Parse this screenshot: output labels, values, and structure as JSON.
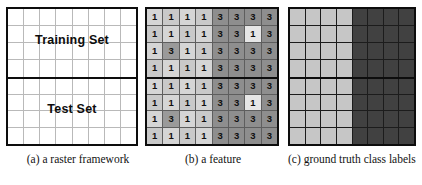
{
  "figure": {
    "panels": [
      {
        "id": "raster-framework",
        "caption": "(a)  a raster framework",
        "labels": {
          "training": "Training Set",
          "test": "Test Set"
        }
      },
      {
        "id": "feature",
        "caption": "(b)  a feature"
      },
      {
        "id": "ground-truth",
        "caption": "(c)  ground truth class labels"
      }
    ]
  },
  "colors": {
    "border": "#0d0d0d",
    "panel_a_grid_line": "#b9b9b9",
    "panel_a_fill": "#ffffff",
    "feature_light": "#c9c9c9",
    "feature_light_alt": "#d5d5d5",
    "feature_dark": "#8e8e8e",
    "feature_anomaly_dark": "#9a9a9a",
    "feature_anomaly_light": "#e6e6e6",
    "class_label_light": "#c6c6c6",
    "class_label_dark": "#414141"
  },
  "chart_data": {
    "type": "heatmap",
    "grid_size": [
      8,
      8
    ],
    "split": {
      "training_rows": [
        0,
        1,
        2,
        3
      ],
      "test_rows": [
        4,
        5,
        6,
        7
      ]
    },
    "panel_a": {
      "title": "(a)  a raster framework",
      "description": "8 x 8 empty raster grid split horizontally into a Training Set half (top 4 rows) and a Test Set half (bottom 4 rows)",
      "rows": [
        [
          "",
          "",
          "",
          "",
          "",
          "",
          "",
          ""
        ],
        [
          "",
          "",
          "",
          "",
          "",
          "",
          "",
          ""
        ],
        [
          "",
          "",
          "",
          "",
          "",
          "",
          "",
          ""
        ],
        [
          "",
          "",
          "",
          "",
          "",
          "",
          "",
          ""
        ],
        [
          "",
          "",
          "",
          "",
          "",
          "",
          "",
          ""
        ],
        [
          "",
          "",
          "",
          "",
          "",
          "",
          "",
          ""
        ],
        [
          "",
          "",
          "",
          "",
          "",
          "",
          "",
          ""
        ],
        [
          "",
          "",
          "",
          "",
          "",
          "",
          "",
          ""
        ]
      ]
    },
    "panel_b": {
      "title": "(b)  a feature",
      "description": "8 x 8 grid of feature values; left four columns are 1 on light background, right four columns are 3 on dark background, with two anomalies",
      "values": [
        [
          1,
          1,
          1,
          1,
          3,
          3,
          3,
          3
        ],
        [
          1,
          1,
          1,
          1,
          3,
          3,
          1,
          3
        ],
        [
          1,
          3,
          1,
          1,
          3,
          3,
          3,
          3
        ],
        [
          1,
          1,
          1,
          1,
          3,
          3,
          3,
          3
        ],
        [
          1,
          1,
          1,
          1,
          3,
          3,
          3,
          3
        ],
        [
          1,
          1,
          1,
          1,
          3,
          3,
          1,
          3
        ],
        [
          1,
          3,
          1,
          1,
          3,
          3,
          3,
          3
        ],
        [
          1,
          1,
          1,
          1,
          3,
          3,
          3,
          3
        ]
      ],
      "shades": [
        [
          "light",
          "light",
          "light",
          "light",
          "dark",
          "dark",
          "dark",
          "dark"
        ],
        [
          "light",
          "light",
          "light",
          "light",
          "dark",
          "dark",
          "anomaly_light",
          "dark"
        ],
        [
          "light",
          "anomaly_dark",
          "light",
          "light",
          "dark",
          "dark",
          "dark",
          "dark"
        ],
        [
          "light",
          "light",
          "light",
          "light",
          "dark",
          "dark",
          "dark",
          "dark"
        ],
        [
          "light",
          "light",
          "light",
          "light",
          "dark",
          "dark",
          "dark",
          "dark"
        ],
        [
          "light",
          "light",
          "light",
          "light",
          "dark",
          "dark",
          "anomaly_light",
          "dark"
        ],
        [
          "light",
          "anomaly_dark",
          "light",
          "light",
          "dark",
          "dark",
          "dark",
          "dark"
        ],
        [
          "light",
          "light",
          "light",
          "light",
          "dark",
          "dark",
          "dark",
          "dark"
        ]
      ],
      "anomalies": [
        {
          "row": 1,
          "col": 6,
          "value": 1,
          "note": "outlier 1 inside the 3 region"
        },
        {
          "row": 2,
          "col": 1,
          "value": 3,
          "note": "outlier 3 inside the 1 region"
        },
        {
          "row": 5,
          "col": 6,
          "value": 1,
          "note": "outlier 1 inside the 3 region"
        },
        {
          "row": 6,
          "col": 1,
          "value": 3,
          "note": "outlier 3 inside the 1 region"
        }
      ]
    },
    "panel_c": {
      "title": "(c)  ground truth class labels",
      "description": "8 x 8 grid of ground truth class labels; left four columns class A (light gray), right four columns class B (dark gray)",
      "classes": [
        {
          "name": "class-a",
          "color": "#c6c6c6"
        },
        {
          "name": "class-b",
          "color": "#414141"
        }
      ],
      "labels": [
        [
          "a",
          "a",
          "a",
          "a",
          "b",
          "b",
          "b",
          "b"
        ],
        [
          "a",
          "a",
          "a",
          "a",
          "b",
          "b",
          "b",
          "b"
        ],
        [
          "a",
          "a",
          "a",
          "a",
          "b",
          "b",
          "b",
          "b"
        ],
        [
          "a",
          "a",
          "a",
          "a",
          "b",
          "b",
          "b",
          "b"
        ],
        [
          "a",
          "a",
          "a",
          "a",
          "b",
          "b",
          "b",
          "b"
        ],
        [
          "a",
          "a",
          "a",
          "a",
          "b",
          "b",
          "b",
          "b"
        ],
        [
          "a",
          "a",
          "a",
          "a",
          "b",
          "b",
          "b",
          "b"
        ],
        [
          "a",
          "a",
          "a",
          "a",
          "b",
          "b",
          "b",
          "b"
        ]
      ]
    }
  }
}
